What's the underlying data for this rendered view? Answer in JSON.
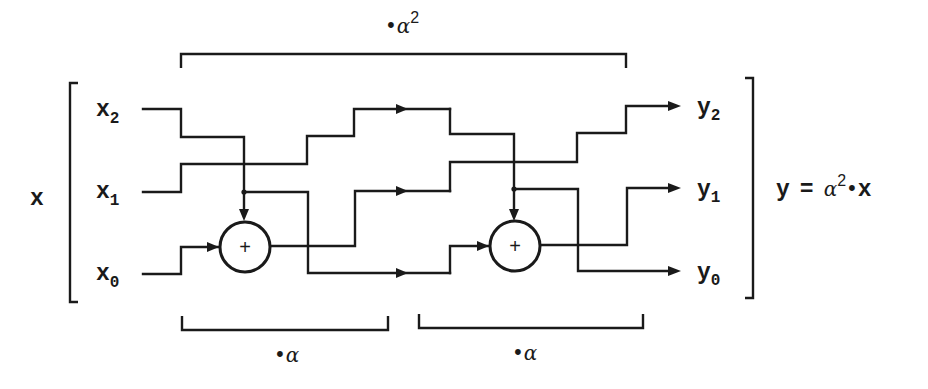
{
  "diagram": {
    "input_vector_label": "x",
    "inputs": [
      {
        "name": "x",
        "sub": "2"
      },
      {
        "name": "x",
        "sub": "1"
      },
      {
        "name": "x",
        "sub": "0"
      }
    ],
    "outputs": [
      {
        "name": "y",
        "sub": "2"
      },
      {
        "name": "y",
        "sub": "1"
      },
      {
        "name": "y",
        "sub": "0"
      }
    ],
    "adder_symbol": "+",
    "top_bracket": {
      "dot": "•",
      "symbol": "α",
      "exp": "2"
    },
    "stage_brackets": [
      {
        "dot": "•",
        "symbol": "α"
      },
      {
        "dot": "•",
        "symbol": "α"
      }
    ],
    "equation": {
      "lhs": "y",
      "eq": "=",
      "symbol": "α",
      "exp": "2",
      "op": "•",
      "rhs": "x"
    },
    "colors": {
      "stroke": "#1a1a1a",
      "background": "#ffffff"
    }
  }
}
